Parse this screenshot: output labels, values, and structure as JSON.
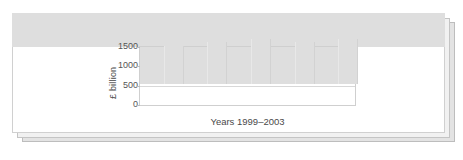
{
  "card": {
    "background_color": "#ffffff",
    "border_color": "#d0d0d0",
    "stack_shadow_colors": [
      "#f1f1f1",
      "#e3e3e3"
    ]
  },
  "chart_data": {
    "type": "bar",
    "title": "",
    "subtitle": "",
    "xlabel": "Years 1999–2003",
    "ylabel": "£ billion",
    "categories": [
      "1999",
      "2000",
      "2001",
      "2002",
      "2003"
    ],
    "values": [
      880,
      965,
      990,
      1085,
      1175
    ],
    "ylim": [
      0,
      1500
    ],
    "yticks": [
      0,
      500,
      1000,
      1500
    ],
    "ytick_labels": [
      "0",
      "500",
      "1000",
      "1500"
    ],
    "xtick_labels": [],
    "grid": "horizontal",
    "legend": "none",
    "bar_color": "#dedede",
    "axis_color": "#cfcfcf",
    "gridline_color": "#d8d8d8",
    "text_color": "#4a4a4a"
  }
}
